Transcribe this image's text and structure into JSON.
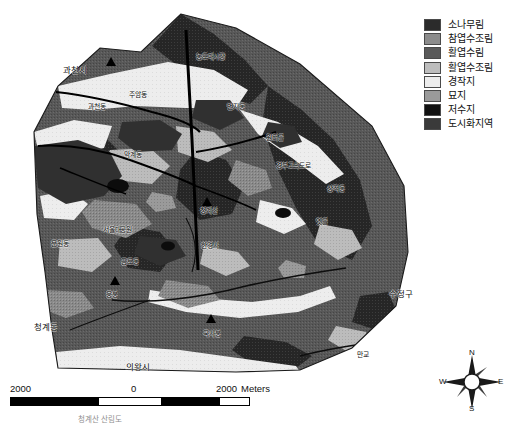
{
  "figure": {
    "caption": "청계산 산림도"
  },
  "legend": {
    "title": "",
    "items": [
      {
        "label": "소나무림",
        "color": "#2b2b2b",
        "pattern": "dark-solid"
      },
      {
        "label": "참엽수조림",
        "color": "#8c8c8c",
        "pattern": "mid-gray"
      },
      {
        "label": "활엽수림",
        "color": "#5a5a5a",
        "pattern": "dark-gray"
      },
      {
        "label": "활엽수조림",
        "color": "#bdbdbd",
        "pattern": "light-gray"
      },
      {
        "label": "경작지",
        "color": "#ececec",
        "pattern": "very-light"
      },
      {
        "label": "묘지",
        "color": "#9a9a9a",
        "pattern": "mid-gray-2"
      },
      {
        "label": "저수지",
        "color": "#111111",
        "pattern": "black"
      },
      {
        "label": "도시화지역",
        "color": "#3a3a3a",
        "pattern": "dark-solid-2"
      }
    ]
  },
  "scale_bar": {
    "left_value": "2000",
    "mid_value": "0",
    "right_value": "2000",
    "units": "Meters"
  },
  "compass": {
    "north": "N",
    "east": "E",
    "south": "S",
    "west": "W"
  },
  "map_labels": [
    {
      "id": "gwacheon-si",
      "text": "과천시",
      "x": 63,
      "y": 66,
      "size": "lg"
    },
    {
      "id": "dodomae-sijang",
      "text": "농도매시장",
      "x": 196,
      "y": 54,
      "size": "md"
    },
    {
      "id": "gwacheon-dong",
      "text": "과천동",
      "x": 88,
      "y": 104,
      "size": "md"
    },
    {
      "id": "juam-dong",
      "text": "주암동",
      "x": 129,
      "y": 92,
      "size": "md"
    },
    {
      "id": "beonji-dong",
      "text": "번지동",
      "x": 227,
      "y": 104,
      "size": "md"
    },
    {
      "id": "wonteo-gol",
      "text": "원터골",
      "x": 266,
      "y": 135,
      "size": "md"
    },
    {
      "id": "makgye-dong",
      "text": "막계동",
      "x": 124,
      "y": 152,
      "size": "md"
    },
    {
      "id": "gyeongbu-expwy",
      "text": "경부고속도로",
      "x": 276,
      "y": 163,
      "size": "md"
    },
    {
      "id": "sangjeok-dong",
      "text": "상적동",
      "x": 327,
      "y": 186,
      "size": "md"
    },
    {
      "id": "cheonggyesan",
      "text": "청계산",
      "x": 200,
      "y": 208,
      "size": "md"
    },
    {
      "id": "yetgol",
      "text": "옛골",
      "x": 316,
      "y": 219,
      "size": "md"
    },
    {
      "id": "sangdeok-won",
      "text": "서울대공원",
      "x": 103,
      "y": 227,
      "size": "md"
    },
    {
      "id": "hangyeseong",
      "text": "한경사",
      "x": 201,
      "y": 243,
      "size": "md"
    },
    {
      "id": "munwon-dong",
      "text": "문원동",
      "x": 51,
      "y": 241,
      "size": "md"
    },
    {
      "id": "geumto-dong",
      "text": "금토동",
      "x": 121,
      "y": 259,
      "size": "md"
    },
    {
      "id": "ungbong",
      "text": "웅봉",
      "x": 106,
      "y": 292,
      "size": "md"
    },
    {
      "id": "cheonggye-dong",
      "text": "청계동",
      "x": 34,
      "y": 323,
      "size": "lg"
    },
    {
      "id": "gooksabong",
      "text": "국사봉",
      "x": 203,
      "y": 331,
      "size": "md"
    },
    {
      "id": "uiwang-si",
      "text": "의왕시",
      "x": 126,
      "y": 363,
      "size": "lg"
    },
    {
      "id": "sujeong-gu",
      "text": "수정구",
      "x": 389,
      "y": 290,
      "size": "lg"
    },
    {
      "id": "angol",
      "text": "만교",
      "x": 357,
      "y": 352,
      "size": "md"
    }
  ],
  "peak_markers": [
    {
      "id": "peak-gwanaksan",
      "x": 106,
      "y": 57
    },
    {
      "id": "peak-cheonggyesan",
      "x": 202,
      "y": 197
    },
    {
      "id": "peak-ungbong",
      "x": 110,
      "y": 276
    },
    {
      "id": "peak-gooksabong",
      "x": 206,
      "y": 314
    }
  ],
  "colors": {
    "pine_forest": "#2b2b2b",
    "mixed_plantation": "#8c8c8c",
    "broadleaf_forest": "#5a5a5a",
    "broadleaf_plantation": "#bdbdbd",
    "farmland": "#ececec",
    "cemetery": "#9a9a9a",
    "reservoir": "#111111",
    "urban": "#3a3a3a",
    "background": "#ffffff",
    "outline": "#1a1a1a"
  }
}
